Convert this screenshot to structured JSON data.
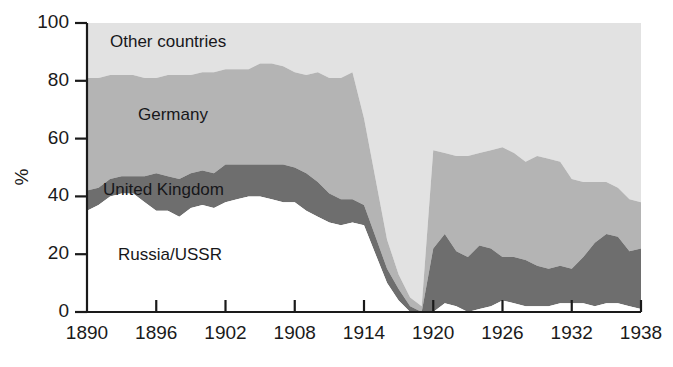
{
  "chart": {
    "y_axis_title": "%",
    "y_ticks": [
      "0",
      "20",
      "40",
      "60",
      "80",
      "100"
    ],
    "x_ticks": [
      "1890",
      "1896",
      "1902",
      "1908",
      "1914",
      "1920",
      "1926",
      "1932",
      "1938"
    ],
    "series_labels": {
      "other": "Other countries",
      "germany": "Germany",
      "uk": "United Kingdom",
      "russia": "Russia/USSR"
    },
    "colors": {
      "other": "#e2e2e2",
      "germany": "#b4b4b4",
      "uk": "#6e6e6e",
      "russia": "#ffffff",
      "axis": "#1a1a1a",
      "text": "#17171a",
      "background": "#ffffff"
    }
  },
  "chart_data": {
    "type": "area",
    "title": "",
    "subtitle": "",
    "xlabel": "",
    "ylabel": "%",
    "xlim": [
      1890,
      1938
    ],
    "ylim": [
      0,
      100
    ],
    "grid": false,
    "legend": "inline-labels",
    "stacked": true,
    "stack_order_bottom_to_top": [
      "Russia/USSR",
      "United Kingdom",
      "Germany",
      "Other countries"
    ],
    "x": [
      1890,
      1891,
      1892,
      1893,
      1894,
      1895,
      1896,
      1897,
      1898,
      1899,
      1900,
      1901,
      1902,
      1903,
      1904,
      1905,
      1906,
      1907,
      1908,
      1909,
      1910,
      1911,
      1912,
      1913,
      1914,
      1915,
      1916,
      1917,
      1918,
      1919,
      1920,
      1921,
      1922,
      1923,
      1924,
      1925,
      1926,
      1927,
      1928,
      1929,
      1930,
      1931,
      1932,
      1933,
      1934,
      1935,
      1936,
      1937,
      1938
    ],
    "series": [
      {
        "name": "Russia/USSR",
        "values": [
          35,
          37,
          40,
          41,
          41,
          38,
          35,
          35,
          33,
          36,
          37,
          36,
          38,
          39,
          40,
          40,
          39,
          38,
          38,
          35,
          33,
          31,
          30,
          31,
          30,
          20,
          10,
          4,
          0,
          0,
          0,
          3,
          2,
          0,
          1,
          2,
          4,
          3,
          2,
          2,
          2,
          3,
          3,
          3,
          2,
          3,
          3,
          2,
          1
        ]
      },
      {
        "name": "United Kingdom",
        "values": [
          7,
          6,
          6,
          6,
          6,
          9,
          13,
          12,
          13,
          12,
          12,
          12,
          13,
          12,
          11,
          11,
          12,
          13,
          12,
          13,
          12,
          10,
          9,
          8,
          7,
          6,
          5,
          4,
          2,
          0,
          22,
          24,
          19,
          19,
          22,
          20,
          15,
          16,
          16,
          14,
          13,
          13,
          12,
          16,
          22,
          24,
          23,
          19,
          21
        ]
      },
      {
        "name": "Germany",
        "values": [
          39,
          38,
          36,
          35,
          35,
          34,
          33,
          35,
          36,
          34,
          34,
          35,
          33,
          33,
          33,
          35,
          35,
          34,
          33,
          34,
          38,
          40,
          42,
          44,
          30,
          20,
          10,
          5,
          3,
          2,
          34,
          28,
          33,
          35,
          32,
          34,
          38,
          36,
          34,
          38,
          38,
          36,
          31,
          26,
          21,
          18,
          17,
          18,
          16
        ]
      },
      {
        "name": "Other countries",
        "values": [
          19,
          19,
          18,
          18,
          18,
          19,
          19,
          18,
          18,
          18,
          17,
          17,
          16,
          16,
          16,
          14,
          14,
          15,
          17,
          18,
          17,
          19,
          19,
          17,
          33,
          54,
          75,
          87,
          95,
          98,
          44,
          45,
          46,
          46,
          45,
          44,
          43,
          45,
          48,
          46,
          47,
          48,
          54,
          55,
          55,
          55,
          57,
          61,
          62
        ]
      }
    ],
    "cumulative_upper_bounds": {
      "russia_top": [
        35,
        37,
        40,
        41,
        41,
        38,
        35,
        35,
        33,
        36,
        37,
        36,
        38,
        39,
        40,
        40,
        39,
        38,
        38,
        35,
        33,
        31,
        30,
        31,
        30,
        20,
        10,
        4,
        0,
        0,
        0,
        3,
        2,
        0,
        1,
        2,
        4,
        3,
        2,
        2,
        2,
        3,
        3,
        3,
        2,
        3,
        3,
        2,
        1
      ],
      "uk_top": [
        42,
        43,
        46,
        47,
        47,
        47,
        48,
        47,
        46,
        48,
        49,
        48,
        51,
        51,
        51,
        51,
        51,
        51,
        50,
        48,
        45,
        41,
        39,
        39,
        37,
        26,
        15,
        8,
        2,
        0,
        22,
        27,
        21,
        19,
        23,
        22,
        19,
        19,
        18,
        16,
        15,
        16,
        15,
        19,
        24,
        27,
        26,
        21,
        22
      ],
      "germany_top": [
        81,
        81,
        82,
        82,
        82,
        81,
        81,
        82,
        82,
        82,
        83,
        83,
        84,
        84,
        84,
        86,
        86,
        85,
        83,
        82,
        83,
        81,
        81,
        83,
        67,
        46,
        25,
        13,
        5,
        2,
        56,
        55,
        54,
        54,
        55,
        56,
        57,
        55,
        52,
        54,
        53,
        52,
        46,
        45,
        45,
        45,
        43,
        39,
        38
      ],
      "other_top": [
        100,
        100,
        100,
        100,
        100,
        100,
        100,
        100,
        100,
        100,
        100,
        100,
        100,
        100,
        100,
        100,
        100,
        100,
        100,
        100,
        100,
        100,
        100,
        100,
        100,
        100,
        100,
        100,
        100,
        100,
        100,
        100,
        100,
        100,
        100,
        100,
        100,
        100,
        100,
        100,
        100,
        100,
        100,
        100,
        100,
        100,
        100,
        100,
        100
      ]
    }
  }
}
